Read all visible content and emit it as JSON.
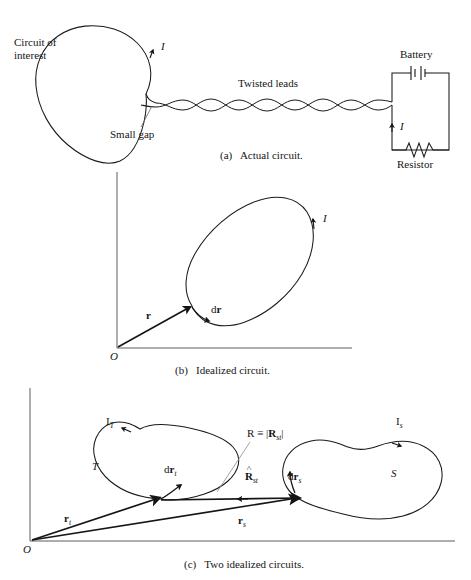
{
  "figure": {
    "title_caption_style": "textbook-figure",
    "panels": [
      {
        "id": "a",
        "caption_prefix": "(a)",
        "caption_text": "Actual circuit.",
        "labels": {
          "circuit_of_interest_line1": "Circuit of",
          "circuit_of_interest_line2": "interest",
          "current": "I",
          "small_gap": "Small gap",
          "twisted_leads": "Twisted leads",
          "battery": "Battery",
          "resistor": "Resistor",
          "current_right": "I"
        }
      },
      {
        "id": "b",
        "caption_prefix": "(b)",
        "caption_text": "Idealized circuit.",
        "labels": {
          "origin": "O",
          "position_vector": "r",
          "element_vector_d": "d",
          "element_vector_r": "r",
          "current": "I"
        }
      },
      {
        "id": "c",
        "caption_prefix": "(c)",
        "caption_text": "Two idealized circuits.",
        "labels": {
          "origin": "O",
          "current_t": "I",
          "current_t_sub": "T",
          "current_s": "I",
          "current_s_sub": "s",
          "loop_t": "T",
          "loop_s": "S",
          "drt_d": "d",
          "drt_r": "r",
          "drt_sub": "t",
          "drs_d": "d",
          "drs_r": "r",
          "drs_sub": "s",
          "rt_r": "r",
          "rt_sub": "t",
          "rs_r": "r",
          "rs_sub": "s",
          "R_def_R": "R",
          "R_def_equiv": "≡",
          "R_def_bar_open": "|",
          "R_def_vec": "R",
          "R_def_vec_sub": "st",
          "R_def_bar_close": "|",
          "Rhat_vec": "R",
          "Rhat_sub": "st",
          "Rhat_mark": "˄"
        }
      }
    ]
  },
  "colors": {
    "ink": "#151515",
    "stroke": "#1a1a1a",
    "background": "#ffffff",
    "leader": "#6b6b6b"
  }
}
